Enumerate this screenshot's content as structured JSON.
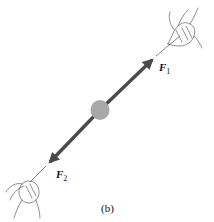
{
  "diagram": {
    "caption": "(b)",
    "forces": [
      {
        "symbol": "F",
        "subscript": "1",
        "direction": "up-right"
      },
      {
        "symbol": "F",
        "subscript": "2",
        "direction": "down-left"
      }
    ],
    "object": "ball",
    "colors": {
      "arrow": "#4a4a4a",
      "ball": "#a8a8a8",
      "ink": "#333333"
    }
  }
}
